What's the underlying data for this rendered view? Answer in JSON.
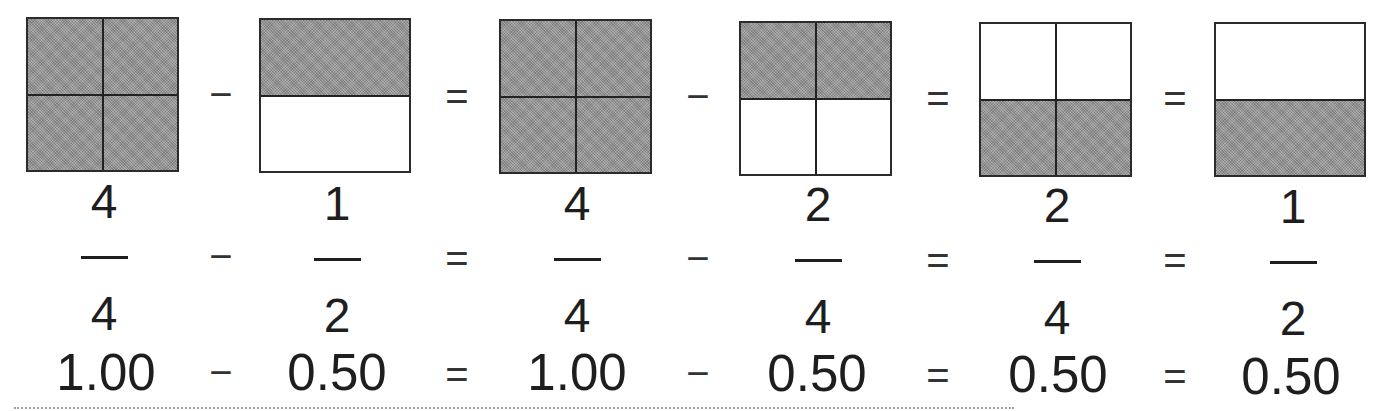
{
  "diagram": {
    "title": "",
    "colors": {
      "shaded": "#999999",
      "border": "#2b2b2b",
      "text": "#1e1e1e",
      "background": "#ffffff"
    },
    "boxes": [
      {
        "id": 1,
        "grid": "2x2",
        "rows": 2,
        "cols": 2,
        "shaded_cells": [
          "top-left",
          "top-right",
          "bottom-left",
          "bottom-right"
        ],
        "shaded_count": 4,
        "total_parts": 4
      },
      {
        "id": 2,
        "grid": "2x1",
        "rows": 2,
        "cols": 1,
        "shaded_cells": [
          "top"
        ],
        "shaded_count": 1,
        "total_parts": 2
      },
      {
        "id": 3,
        "grid": "2x2",
        "rows": 2,
        "cols": 2,
        "shaded_cells": [
          "top-left",
          "top-right",
          "bottom-left",
          "bottom-right"
        ],
        "shaded_count": 4,
        "total_parts": 4
      },
      {
        "id": 4,
        "grid": "2x2",
        "rows": 2,
        "cols": 2,
        "shaded_cells": [
          "top-left",
          "top-right"
        ],
        "shaded_count": 2,
        "total_parts": 4
      },
      {
        "id": 5,
        "grid": "2x2",
        "rows": 2,
        "cols": 2,
        "shaded_cells": [
          "bottom-left",
          "bottom-right"
        ],
        "shaded_count": 2,
        "total_parts": 4
      },
      {
        "id": 6,
        "grid": "2x1",
        "rows": 2,
        "cols": 1,
        "shaded_cells": [
          "bottom"
        ],
        "shaded_count": 1,
        "total_parts": 2
      }
    ],
    "operators": [
      "−",
      "=",
      "−",
      "=",
      "="
    ],
    "fractions": [
      {
        "numerator": "4",
        "denominator": "4"
      },
      {
        "numerator": "1",
        "denominator": "2"
      },
      {
        "numerator": "4",
        "denominator": "4"
      },
      {
        "numerator": "2",
        "denominator": "4"
      },
      {
        "numerator": "2",
        "denominator": "4"
      },
      {
        "numerator": "1",
        "denominator": "2"
      }
    ],
    "decimals": [
      "1.00",
      "0.50",
      "1.00",
      "0.50",
      "0.50",
      "0.50"
    ]
  }
}
